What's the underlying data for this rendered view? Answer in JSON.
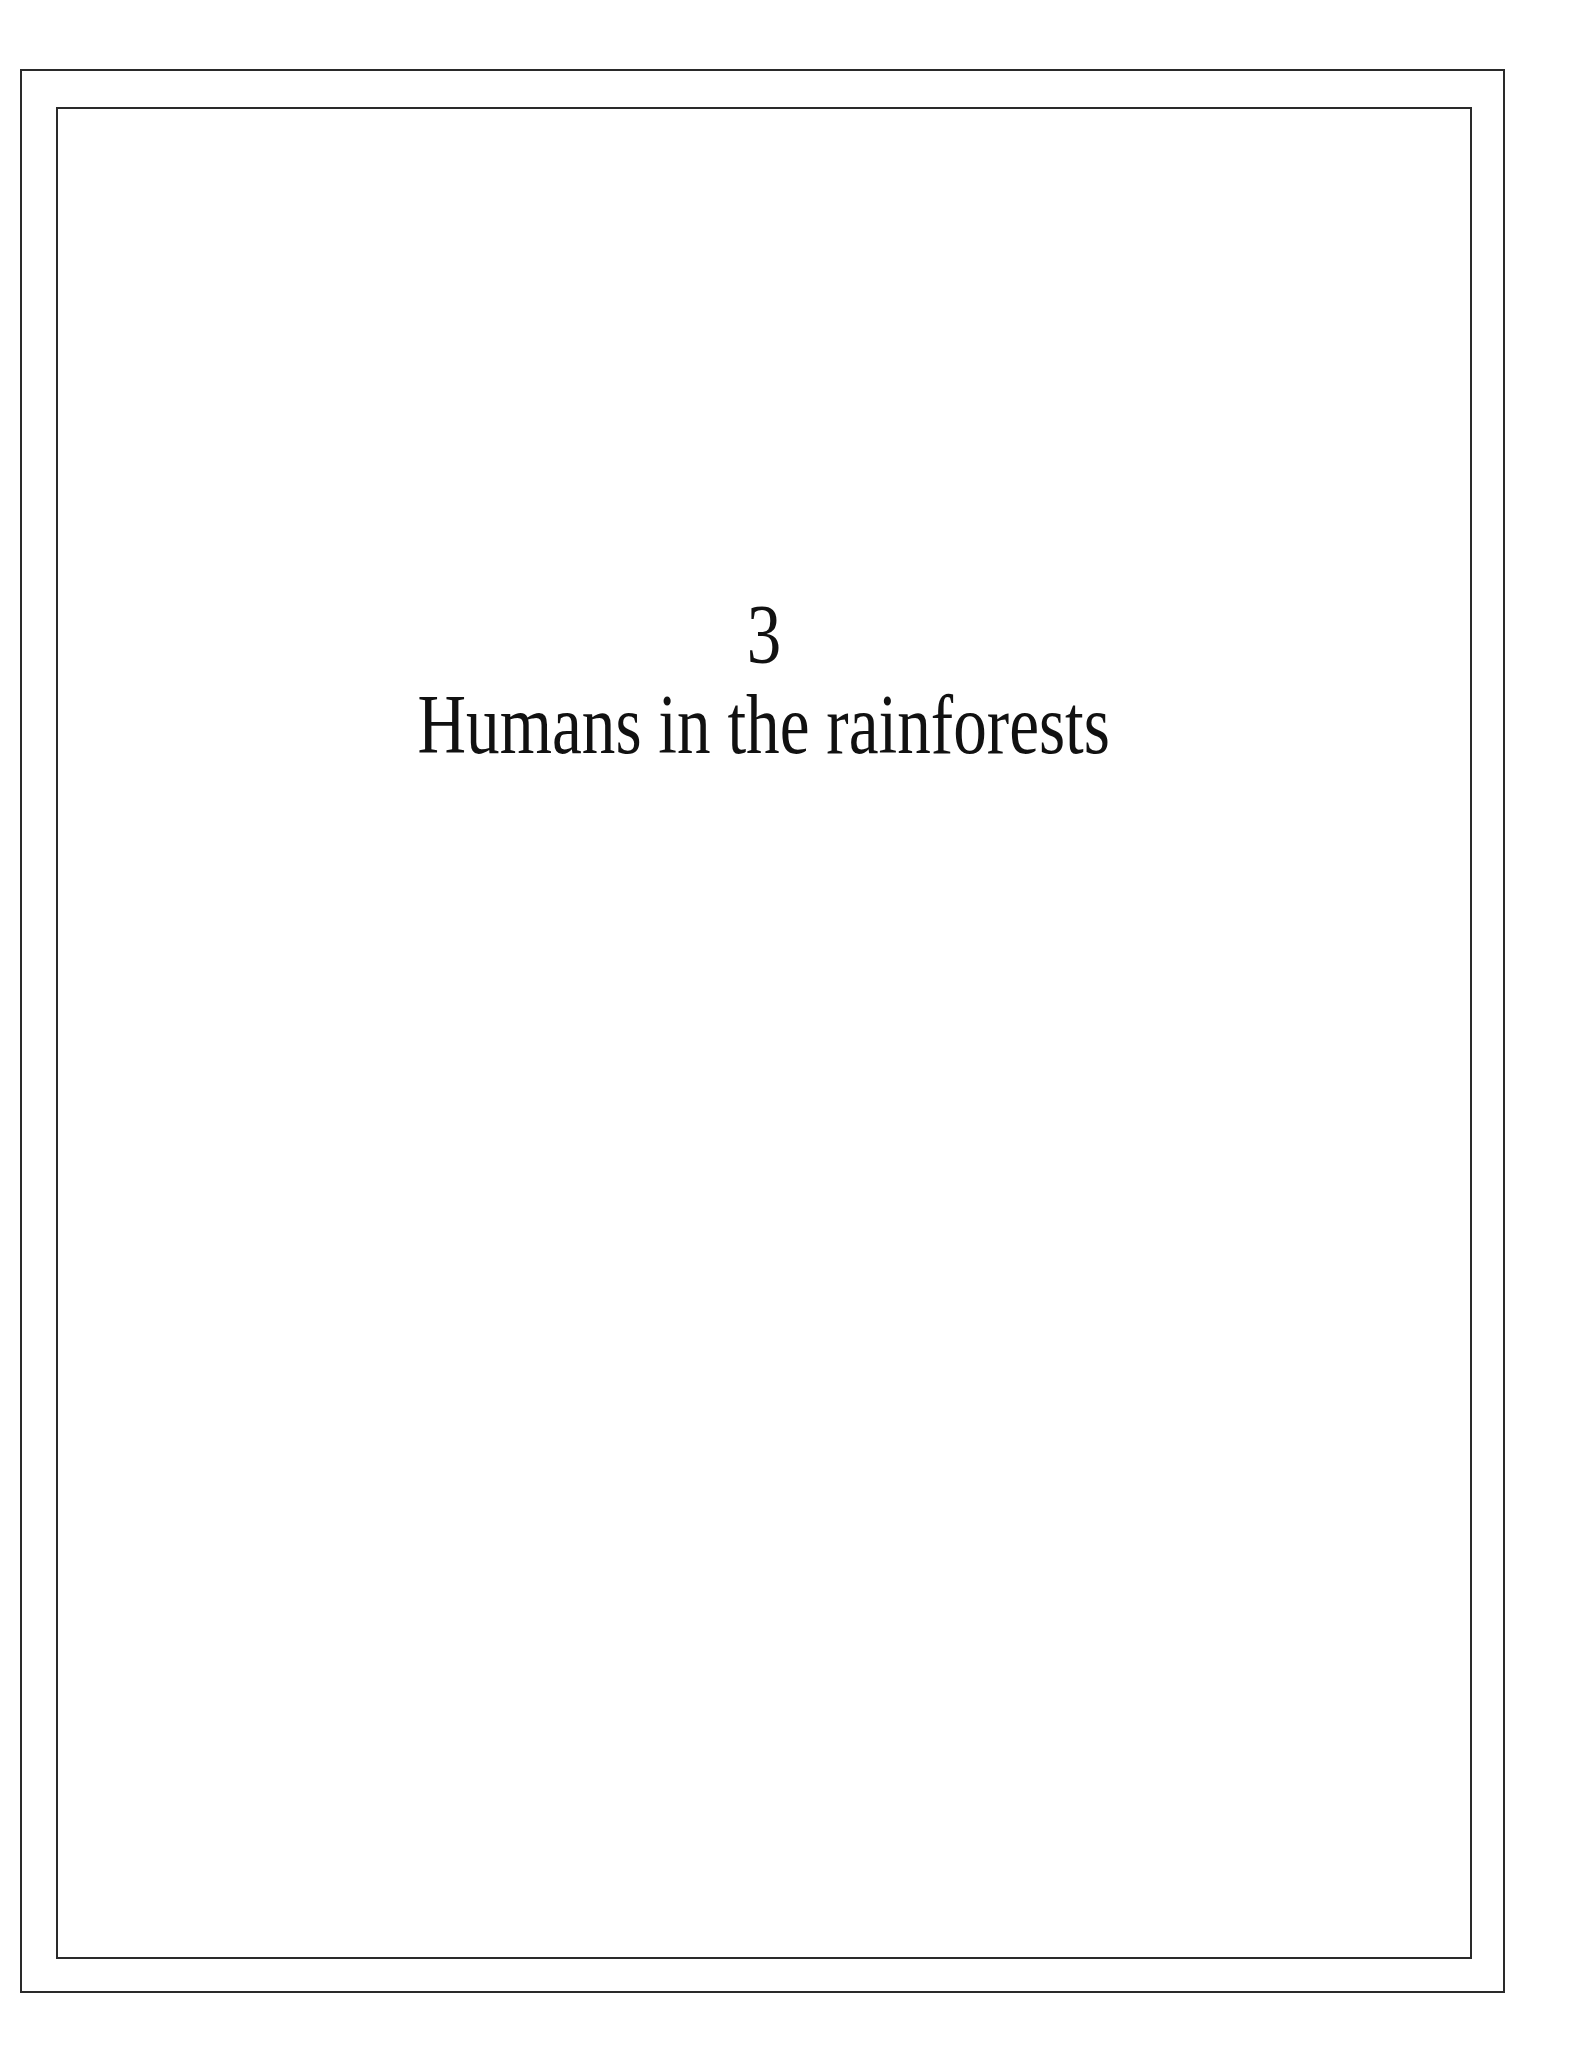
{
  "page": {
    "chapter_number": "3",
    "chapter_title": "Humans in the rainforests"
  }
}
